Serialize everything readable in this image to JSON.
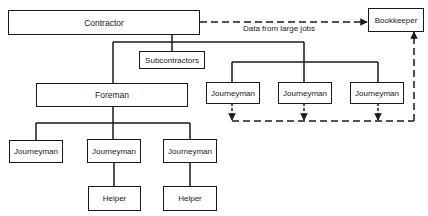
{
  "diagram": {
    "nodes": {
      "contractor": "Contractor",
      "bookkeeper": "Bookkeeper",
      "subcontractors": "Subcontractors",
      "foreman": "Foreman",
      "journeyman_r1": "Journeyman",
      "journeyman_r2": "Journeyman",
      "journeyman_r3": "Journeyman",
      "journeyman_b1": "Journeyman",
      "journeyman_b2": "Journeyman",
      "journeyman_b3": "Journeyman",
      "helper_1": "Helper",
      "helper_2": "Helper"
    },
    "edge_labels": {
      "data_flow": "Data from large jobs"
    },
    "colors": {
      "line": "#1a1a1a",
      "background": "#ffffff"
    }
  }
}
